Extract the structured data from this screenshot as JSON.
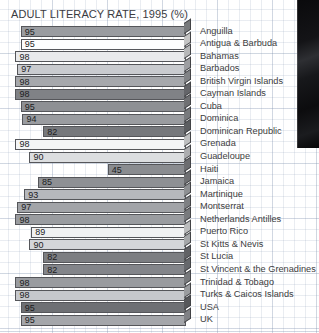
{
  "chart_data": {
    "type": "bar",
    "orientation": "horizontal",
    "title": "ADULT LITERACY RATE, 1995 (%)",
    "xlabel": "",
    "ylabel": "",
    "xlim": [
      0,
      100
    ],
    "grid": true,
    "legend": "none",
    "categories": [
      "Anguilla",
      "Antigua & Barbuda",
      "Bahamas",
      "Barbados",
      "British Virgin Islands",
      "Cayman Islands",
      "Cuba",
      "Dominica",
      "Dominican Republic",
      "Grenada",
      "Guadeloupe",
      "Haiti",
      "Jamaica",
      "Martinique",
      "Montserrat",
      "Netherlands Antilles",
      "Puerto Rico",
      "St Kitts & Nevis",
      "St Lucia",
      "St Vincent & the Grenadines",
      "Trinidad & Tobago",
      "Turks & Caicos Islands",
      "USA",
      "UK"
    ],
    "values": [
      95,
      95,
      98,
      97,
      98,
      98,
      95,
      94,
      82,
      98,
      90,
      45,
      85,
      93,
      97,
      98,
      89,
      90,
      82,
      82,
      98,
      98,
      95,
      95
    ],
    "bar_colors": [
      "#9a9ca0",
      "#fdfdfd",
      "#e9eaec",
      "#c9cbcf",
      "#a6a8ac",
      "#808286",
      "#8e9094",
      "#9a9ca0",
      "#76787c",
      "#f4f5f6",
      "#dcdee0",
      "#8a8c90",
      "#8e9094",
      "#b6b8bc",
      "#a2a4a8",
      "#9a9ca0",
      "#f0f1f2",
      "#d4d6d9",
      "#7c7e82",
      "#83858a",
      "#999b9f",
      "#c6c8cc",
      "#6e7074",
      "#a4a6aa"
    ]
  }
}
